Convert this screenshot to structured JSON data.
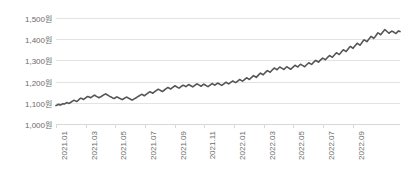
{
  "chart_data": {
    "type": "line",
    "title": "",
    "subtitle": "",
    "xlabel": "",
    "ylabel": "",
    "grid": true,
    "legend": false,
    "legend_position": "none",
    "currency_suffix": "원",
    "line_color": "#555555",
    "grid_color": "#e3e3e3",
    "axis_color": "#d8d8d8",
    "tick_label_color": "#6b6b6b",
    "ylim": [
      1000,
      1500
    ],
    "yticks": [
      1500,
      1400,
      1300,
      1200,
      1100,
      1000
    ],
    "ytick_labels": [
      "1,500원",
      "1,400원",
      "1,300원",
      "1,200원",
      "1,100원",
      "1,000원"
    ],
    "xtick_labels": [
      "2021.01",
      "2021.03",
      "2021.05",
      "2021.07",
      "2021.09",
      "2021.11",
      "2022.01",
      "2022.03",
      "2022.05",
      "2022.07",
      "2022.09"
    ],
    "xlim": [
      "2021.01",
      "2022.10"
    ],
    "series": [
      {
        "name": "USD/KRW",
        "values": [
          1087,
          1090,
          1093,
          1089,
          1092,
          1096,
          1094,
          1098,
          1101,
          1097,
          1099,
          1104,
          1108,
          1112,
          1109,
          1106,
          1111,
          1118,
          1122,
          1119,
          1116,
          1121,
          1126,
          1130,
          1127,
          1124,
          1128,
          1133,
          1136,
          1131,
          1128,
          1124,
          1127,
          1131,
          1135,
          1139,
          1142,
          1138,
          1134,
          1130,
          1127,
          1123,
          1120,
          1124,
          1128,
          1125,
          1121,
          1118,
          1115,
          1119,
          1123,
          1127,
          1124,
          1120,
          1117,
          1113,
          1116,
          1120,
          1124,
          1128,
          1132,
          1136,
          1140,
          1137,
          1133,
          1138,
          1143,
          1148,
          1152,
          1149,
          1145,
          1150,
          1155,
          1160,
          1164,
          1161,
          1157,
          1153,
          1158,
          1163,
          1168,
          1172,
          1169,
          1165,
          1170,
          1175,
          1180,
          1177,
          1173,
          1169,
          1174,
          1179,
          1183,
          1180,
          1176,
          1181,
          1186,
          1183,
          1179,
          1175,
          1180,
          1185,
          1189,
          1186,
          1182,
          1178,
          1183,
          1188,
          1184,
          1180,
          1176,
          1181,
          1186,
          1191,
          1187,
          1183,
          1188,
          1193,
          1190,
          1186,
          1182,
          1187,
          1192,
          1197,
          1193,
          1189,
          1194,
          1199,
          1203,
          1199,
          1195,
          1200,
          1205,
          1210,
          1206,
          1202,
          1207,
          1213,
          1218,
          1214,
          1210,
          1216,
          1222,
          1228,
          1224,
          1220,
          1227,
          1234,
          1240,
          1236,
          1232,
          1239,
          1246,
          1252,
          1248,
          1244,
          1251,
          1258,
          1264,
          1260,
          1256,
          1263,
          1269,
          1265,
          1261,
          1257,
          1264,
          1270,
          1266,
          1262,
          1258,
          1265,
          1271,
          1277,
          1273,
          1269,
          1276,
          1282,
          1278,
          1274,
          1270,
          1277,
          1283,
          1289,
          1285,
          1281,
          1288,
          1294,
          1300,
          1296,
          1292,
          1299,
          1305,
          1311,
          1307,
          1303,
          1310,
          1317,
          1323,
          1319,
          1315,
          1322,
          1329,
          1336,
          1332,
          1328,
          1335,
          1343,
          1350,
          1346,
          1342,
          1350,
          1358,
          1366,
          1362,
          1357,
          1365,
          1373,
          1381,
          1377,
          1372,
          1380,
          1389,
          1397,
          1393,
          1388,
          1396,
          1405,
          1413,
          1409,
          1404,
          1412,
          1421,
          1430,
          1426,
          1421,
          1429,
          1437,
          1445,
          1440,
          1434,
          1428,
          1433,
          1438,
          1436,
          1431,
          1427,
          1433,
          1439,
          1436
        ]
      }
    ]
  }
}
